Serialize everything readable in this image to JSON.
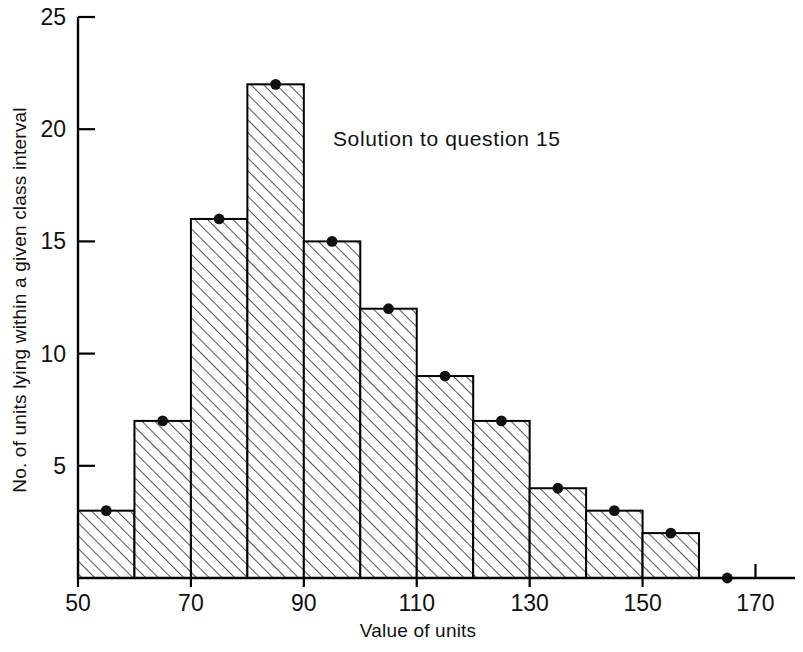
{
  "chart_data": {
    "type": "bar",
    "title": "",
    "annotation": "Solution to question 15",
    "xlabel": "Value of units",
    "ylabel": "No. of units lying within a given class interval",
    "xlim": [
      50,
      177
    ],
    "ylim": [
      0,
      25
    ],
    "xticks": [
      50,
      70,
      90,
      110,
      130,
      150,
      170
    ],
    "xtick_labels": [
      "50",
      "70",
      "90",
      "110",
      "130",
      "150",
      "170"
    ],
    "yticks": [
      5,
      10,
      15,
      20,
      25
    ],
    "ytick_labels": [
      "5",
      "10",
      "15",
      "20",
      "25"
    ],
    "grid": false,
    "legend": "none",
    "bin_width": 10,
    "bin_edges": [
      50,
      60,
      70,
      80,
      90,
      100,
      110,
      120,
      130,
      140,
      150,
      160
    ],
    "categories": [
      "50-60",
      "60-70",
      "70-80",
      "80-90",
      "90-100",
      "100-110",
      "110-120",
      "120-130",
      "130-140",
      "140-150",
      "150-160"
    ],
    "values": [
      3,
      7,
      16,
      22,
      15,
      12,
      9,
      7,
      4,
      3,
      2
    ],
    "markers": {
      "description": "frequency-polygon points at class midpoints",
      "x": [
        55,
        65,
        75,
        85,
        95,
        105,
        115,
        125,
        135,
        145,
        155,
        165
      ],
      "y": [
        3,
        7,
        16,
        22,
        15,
        12,
        9,
        7,
        4,
        3,
        2,
        0
      ]
    },
    "bar_style": {
      "fill": "hatched-diagonal",
      "edge_color": "#000000",
      "hatch_color": "#222222"
    }
  },
  "figure": {
    "background_color": "#ffffff",
    "axis_color": "#000000"
  }
}
